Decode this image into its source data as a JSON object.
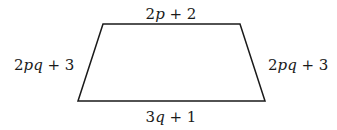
{
  "diagram": {
    "shape": "trapezoid",
    "vertices": [
      [
        103,
        24
      ],
      [
        240,
        24
      ],
      [
        265,
        101
      ],
      [
        78,
        101
      ]
    ],
    "stroke_color": "#1a1a1a",
    "labels": {
      "top": {
        "coef": "2",
        "var": "p",
        "rest": " + 2"
      },
      "left": {
        "coef": "2",
        "var": "pq",
        "rest": " + 3"
      },
      "right": {
        "coef": "2",
        "var": "pq",
        "rest": " + 3"
      },
      "bottom": {
        "coef": "3",
        "var": "q",
        "rest": " + 1"
      }
    }
  }
}
